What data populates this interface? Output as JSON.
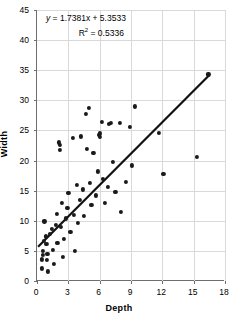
{
  "chart_data": {
    "type": "scatter",
    "title": "",
    "xlabel": "Depth",
    "ylabel": "Width",
    "xlim": [
      0,
      18
    ],
    "ylim": [
      0,
      45
    ],
    "xticks": [
      0,
      3,
      6,
      9,
      12,
      15,
      18
    ],
    "yticks": [
      0,
      5,
      10,
      15,
      20,
      25,
      30,
      35,
      40,
      45
    ],
    "grid": true,
    "legend": "none",
    "annotations": {
      "equation": "y = 1.7381x + 5.3533",
      "equation_y": "y",
      "equation_rest": " = 1.7381x + 5.3533",
      "r_squared_label": "R",
      "r_squared_exp": "2",
      "r_squared_value": " = 0.5336",
      "r_squared_full": "R2 = 0.5336"
    },
    "trendline": {
      "type": "linear",
      "slope": 1.7381,
      "intercept": 5.3533,
      "x_start": 0.2,
      "x_end": 16.6,
      "color": "#111111"
    },
    "point_color": "#1a1a1a",
    "points": [
      {
        "x": 0.55,
        "y": 2.1
      },
      {
        "x": 0.6,
        "y": 3.6
      },
      {
        "x": 0.65,
        "y": 4.3
      },
      {
        "x": 0.7,
        "y": 5.0
      },
      {
        "x": 0.75,
        "y": 6.6
      },
      {
        "x": 0.8,
        "y": 9.9
      },
      {
        "x": 0.95,
        "y": 7.4
      },
      {
        "x": 1.0,
        "y": 6.2
      },
      {
        "x": 1.05,
        "y": 3.5
      },
      {
        "x": 1.1,
        "y": 4.5
      },
      {
        "x": 1.15,
        "y": 1.6
      },
      {
        "x": 1.3,
        "y": 7.8
      },
      {
        "x": 1.5,
        "y": 8.6
      },
      {
        "x": 1.6,
        "y": 5.2
      },
      {
        "x": 1.7,
        "y": 2.8
      },
      {
        "x": 1.9,
        "y": 9.3
      },
      {
        "x": 2.0,
        "y": 11.2
      },
      {
        "x": 2.05,
        "y": 6.3
      },
      {
        "x": 2.2,
        "y": 23.0
      },
      {
        "x": 2.25,
        "y": 22.6
      },
      {
        "x": 2.3,
        "y": 21.8
      },
      {
        "x": 2.4,
        "y": 9.0
      },
      {
        "x": 2.5,
        "y": 13.0
      },
      {
        "x": 2.6,
        "y": 4.0
      },
      {
        "x": 2.7,
        "y": 7.0
      },
      {
        "x": 2.9,
        "y": 10.4
      },
      {
        "x": 3.0,
        "y": 12.1
      },
      {
        "x": 3.1,
        "y": 14.6
      },
      {
        "x": 3.3,
        "y": 8.2
      },
      {
        "x": 3.5,
        "y": 23.8
      },
      {
        "x": 3.6,
        "y": 11.0
      },
      {
        "x": 3.7,
        "y": 5.0
      },
      {
        "x": 3.9,
        "y": 16.0
      },
      {
        "x": 4.0,
        "y": 9.6
      },
      {
        "x": 4.2,
        "y": 13.4
      },
      {
        "x": 4.3,
        "y": 24.0
      },
      {
        "x": 4.5,
        "y": 15.2
      },
      {
        "x": 4.6,
        "y": 10.8
      },
      {
        "x": 4.8,
        "y": 27.7
      },
      {
        "x": 4.9,
        "y": 21.9
      },
      {
        "x": 5.1,
        "y": 28.8
      },
      {
        "x": 5.2,
        "y": 16.3
      },
      {
        "x": 5.3,
        "y": 12.6
      },
      {
        "x": 5.5,
        "y": 21.3
      },
      {
        "x": 5.7,
        "y": 14.2
      },
      {
        "x": 5.9,
        "y": 18.2
      },
      {
        "x": 6.0,
        "y": 24.2
      },
      {
        "x": 6.1,
        "y": 24.5
      },
      {
        "x": 6.15,
        "y": 23.9
      },
      {
        "x": 6.3,
        "y": 26.4
      },
      {
        "x": 6.4,
        "y": 17.0
      },
      {
        "x": 6.6,
        "y": 13.0
      },
      {
        "x": 6.9,
        "y": 15.6
      },
      {
        "x": 7.0,
        "y": 26.1
      },
      {
        "x": 7.2,
        "y": 26.2
      },
      {
        "x": 7.4,
        "y": 19.8
      },
      {
        "x": 7.6,
        "y": 14.8
      },
      {
        "x": 8.0,
        "y": 26.2
      },
      {
        "x": 8.1,
        "y": 11.5
      },
      {
        "x": 8.6,
        "y": 16.5
      },
      {
        "x": 9.0,
        "y": 25.6
      },
      {
        "x": 9.2,
        "y": 19.2
      },
      {
        "x": 9.5,
        "y": 29.0
      },
      {
        "x": 11.8,
        "y": 24.6
      },
      {
        "x": 12.2,
        "y": 17.8
      },
      {
        "x": 15.4,
        "y": 20.6
      },
      {
        "x": 16.5,
        "y": 34.3
      }
    ]
  }
}
